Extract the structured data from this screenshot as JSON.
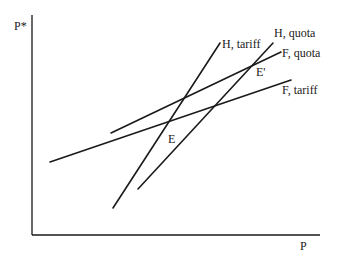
{
  "axes": {
    "y_label": "P*",
    "x_label": "P"
  },
  "curves": [
    {
      "name": "H, tariff",
      "x1": 113,
      "y1": 208,
      "x2": 220,
      "y2": 43,
      "label_x": 222,
      "label_y": 48
    },
    {
      "name": "H, quota",
      "x1": 138,
      "y1": 189,
      "x2": 273,
      "y2": 43,
      "label_x": 274,
      "label_y": 37
    },
    {
      "name": "F, quota",
      "x1": 111,
      "y1": 133,
      "x2": 281,
      "y2": 52,
      "label_x": 282,
      "label_y": 57
    },
    {
      "name": "F, tariff",
      "x1": 50,
      "y1": 162,
      "x2": 291,
      "y2": 80,
      "label_x": 282,
      "label_y": 94
    }
  ],
  "points": [
    {
      "name": "E",
      "x": 168,
      "y": 143
    },
    {
      "name": "E'",
      "x": 256,
      "y": 76
    }
  ],
  "colors": {
    "line": "#1a1a1a",
    "background": "#ffffff"
  }
}
